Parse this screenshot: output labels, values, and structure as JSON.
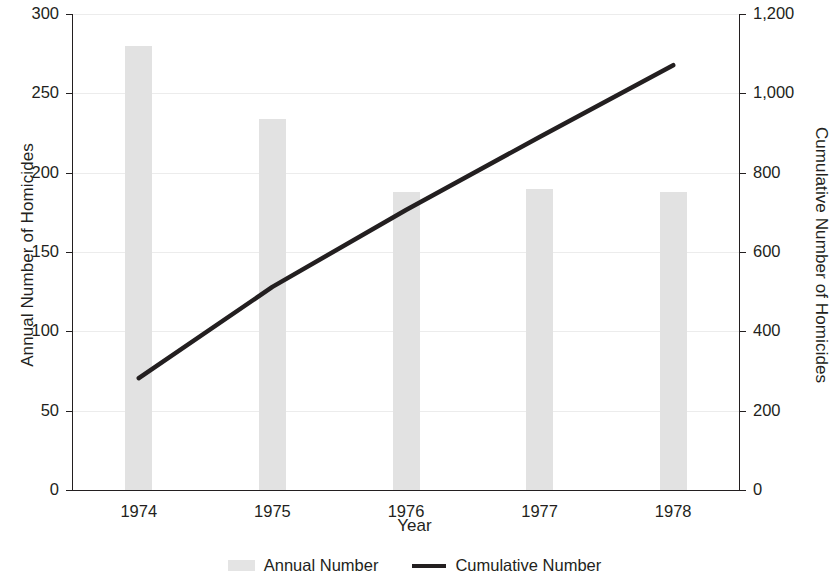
{
  "chart_data": {
    "type": "bar",
    "title": "",
    "xlabel": "Year",
    "ylabel": "Annual Number of Homicides",
    "y2label": "Cumulative Number of Homicides",
    "categories": [
      "1974",
      "1975",
      "1976",
      "1977",
      "1978"
    ],
    "grid": true,
    "legend_position": "bottom",
    "ylim": [
      0,
      300
    ],
    "y2lim": [
      0,
      1200
    ],
    "yticks": [
      "0",
      "50",
      "100",
      "150",
      "200",
      "250",
      "300"
    ],
    "ytick_values": [
      0,
      50,
      100,
      150,
      200,
      250,
      300
    ],
    "y2ticks": [
      "0",
      "200",
      "400",
      "600",
      "800",
      "1,000",
      "1,200"
    ],
    "y2tick_values": [
      0,
      200,
      400,
      600,
      800,
      1000,
      1200
    ],
    "series": [
      {
        "name": "Annual Number",
        "type": "bar",
        "axis": "left",
        "color": "#e2e2e2",
        "values": [
          280,
          234,
          188,
          190,
          188
        ]
      },
      {
        "name": "Cumulative Number",
        "type": "line",
        "axis": "right",
        "color": "#231f20",
        "values": [
          282,
          512,
          706,
          890,
          1071
        ]
      }
    ]
  },
  "legend": {
    "items": [
      {
        "label": "Annual Number",
        "marker": "bar-swatch"
      },
      {
        "label": "Cumulative Number",
        "marker": "line-swatch"
      }
    ]
  }
}
